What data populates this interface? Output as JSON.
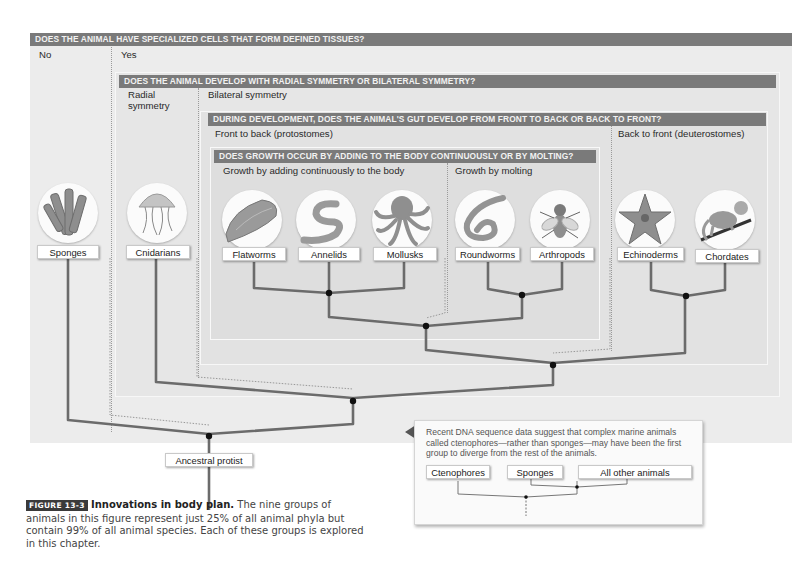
{
  "questions": {
    "q1": {
      "text": "DOES THE ANIMAL HAVE SPECIALIZED CELLS THAT FORM DEFINED TISSUES?",
      "no": "No",
      "yes": "Yes"
    },
    "q2": {
      "text": "DOES THE ANIMAL DEVELOP WITH RADIAL SYMMETRY OR BILATERAL SYMMETRY?",
      "radial": "Radial symmetry",
      "bilateral": "Bilateral symmetry"
    },
    "q3": {
      "text": "DURING DEVELOPMENT, DOES THE ANIMAL'S GUT DEVELOP FROM FRONT TO BACK OR BACK TO FRONT?",
      "front": "Front to back (protostomes)",
      "back": "Back to front (deuterostomes)"
    },
    "q4": {
      "text": "DOES GROWTH OCCUR BY ADDING TO THE BODY CONTINUOUSLY OR BY MOLTING?",
      "continuous": "Growth by adding continuously to the body",
      "molting": "Growth by molting"
    }
  },
  "groups": [
    {
      "name": "Sponges",
      "icon": "sponge-icon"
    },
    {
      "name": "Cnidarians",
      "icon": "jellyfish-icon"
    },
    {
      "name": "Flatworms",
      "icon": "flatworm-icon"
    },
    {
      "name": "Annelids",
      "icon": "annelid-worm-icon"
    },
    {
      "name": "Mollusks",
      "icon": "octopus-icon"
    },
    {
      "name": "Roundworms",
      "icon": "roundworm-icon"
    },
    {
      "name": "Arthropods",
      "icon": "fly-icon"
    },
    {
      "name": "Echinoderms",
      "icon": "starfish-icon"
    },
    {
      "name": "Chordates",
      "icon": "monkey-icon"
    }
  ],
  "root": {
    "label": "Ancestral protist"
  },
  "callout": {
    "text": "Recent DNA sequence data suggest that complex marine animals called ctenophores—rather than sponges—may have been the first group to diverge from the rest of the animals.",
    "labels": [
      "Ctenophores",
      "Sponges",
      "All other animals"
    ]
  },
  "caption": {
    "figure": "FIGURE 13-3",
    "title": "Innovations in body plan.",
    "body": " The nine groups of animals in this figure represent just 25% of all animal phyla but contain 99% of all animal species. Each of these groups is explored in this chapter."
  },
  "colors": {
    "question_bar": "#7a7a7a",
    "branch": "#6b6b6b",
    "node": "#111111"
  }
}
